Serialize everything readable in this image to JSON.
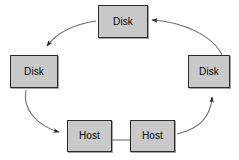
{
  "diagram": {
    "type": "cycle-flow-diagram",
    "canvas": {
      "width": 239,
      "height": 160,
      "background": "#ffffff"
    },
    "style": {
      "node_fill": "#c9c9c9",
      "node_border": "#2b2b2b",
      "edge_color": "#4a4a4a",
      "label_color": "#000000"
    },
    "nodes": [
      {
        "id": "disk-top",
        "label": "Disk",
        "x": 98,
        "y": 5,
        "w": 50,
        "h": 33
      },
      {
        "id": "disk-left",
        "label": "Disk",
        "x": 10,
        "y": 55,
        "w": 48,
        "h": 33
      },
      {
        "id": "disk-right",
        "label": "Disk",
        "x": 188,
        "y": 55,
        "w": 42,
        "h": 33
      },
      {
        "id": "host-left",
        "label": "Host",
        "x": 67,
        "y": 120,
        "w": 45,
        "h": 32
      },
      {
        "id": "host-right",
        "label": "Host",
        "x": 130,
        "y": 120,
        "w": 45,
        "h": 32
      }
    ],
    "edges": [
      {
        "id": "edge-top-to-left",
        "from": "disk-top",
        "to": "disk-left",
        "arrow": true,
        "direction": "counter-clockwise"
      },
      {
        "id": "edge-left-to-host-left",
        "from": "disk-left",
        "to": "host-left",
        "arrow": true,
        "direction": "counter-clockwise"
      },
      {
        "id": "edge-host-right-to-right",
        "from": "host-right",
        "to": "disk-right",
        "arrow": true,
        "direction": "counter-clockwise"
      },
      {
        "id": "edge-right-to-top",
        "from": "disk-right",
        "to": "disk-top",
        "arrow": true,
        "direction": "counter-clockwise"
      },
      {
        "id": "edge-host-link",
        "from": "host-left",
        "to": "host-right",
        "arrow": false,
        "direction": "straight"
      }
    ]
  }
}
